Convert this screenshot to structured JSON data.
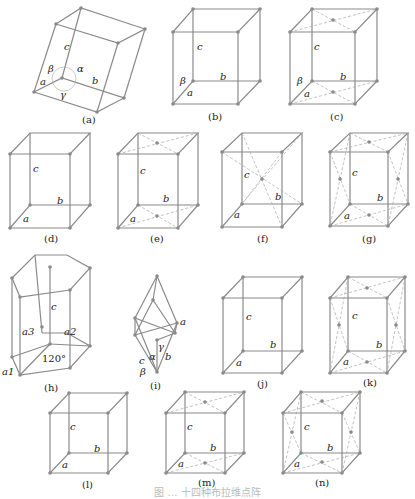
{
  "figure": {
    "caption": "图 … 十四种布拉维点阵",
    "panels": [
      {
        "id": "a",
        "caption": "(a)",
        "labels": {
          "a": "a",
          "b": "b",
          "c": "c",
          "alpha": "α",
          "beta": "β",
          "gamma": "γ"
        }
      },
      {
        "id": "b",
        "caption": "(b)",
        "labels": {
          "a": "a",
          "b": "b",
          "c": "c",
          "beta": "β"
        }
      },
      {
        "id": "c",
        "caption": "(c)",
        "labels": {
          "a": "a",
          "b": "b",
          "c": "c",
          "beta": "β"
        }
      },
      {
        "id": "d",
        "caption": "(d)",
        "labels": {
          "a": "a",
          "b": "b",
          "c": "c"
        }
      },
      {
        "id": "e",
        "caption": "(e)",
        "labels": {
          "a": "a",
          "b": "b",
          "c": "c"
        }
      },
      {
        "id": "f",
        "caption": "(f)",
        "labels": {
          "a": "a",
          "b": "b",
          "c": "c"
        }
      },
      {
        "id": "g",
        "caption": "(g)",
        "labels": {
          "a": "a",
          "b": "b",
          "c": "c"
        }
      },
      {
        "id": "h",
        "caption": "(h)",
        "labels": {
          "a1": "a1",
          "a2": "a2",
          "a3": "a3",
          "c": "c",
          "angle": "120°"
        }
      },
      {
        "id": "i",
        "caption": "(i)",
        "labels": {
          "a": "a",
          "b": "b",
          "c": "c",
          "alpha": "α",
          "beta": "β",
          "gamma": "γ"
        }
      },
      {
        "id": "j",
        "caption": "(j)",
        "labels": {
          "a": "a",
          "b": "b",
          "c": "c"
        }
      },
      {
        "id": "k",
        "caption": "(k)",
        "labels": {
          "a": "a",
          "b": "b",
          "c": "c"
        }
      },
      {
        "id": "l",
        "caption": "(l)",
        "labels": {
          "a": "a",
          "b": "b",
          "c": "c"
        }
      },
      {
        "id": "m",
        "caption": "(m)",
        "labels": {
          "a": "a",
          "b": "b",
          "c": "c"
        }
      },
      {
        "id": "n",
        "caption": "(n)",
        "labels": {
          "a": "a",
          "b": "b",
          "c": "c"
        }
      }
    ]
  }
}
